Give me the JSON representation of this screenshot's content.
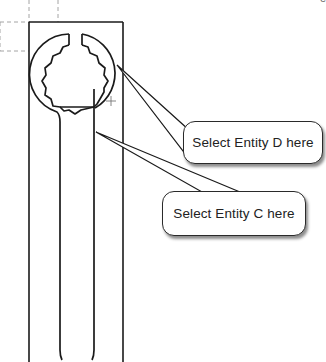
{
  "figure": {
    "type": "CAD sketch of wrench with selection callouts",
    "header_fragment": "e"
  },
  "callouts": [
    {
      "id": "D",
      "label": "Select Entity D here",
      "target": "outer ring arc"
    },
    {
      "id": "C",
      "label": "Select Entity C here",
      "target": "right shank line"
    }
  ],
  "colors": {
    "stroke": "#1a1a1a",
    "dashed": "#9a9a9a",
    "background": "#ffffff"
  }
}
